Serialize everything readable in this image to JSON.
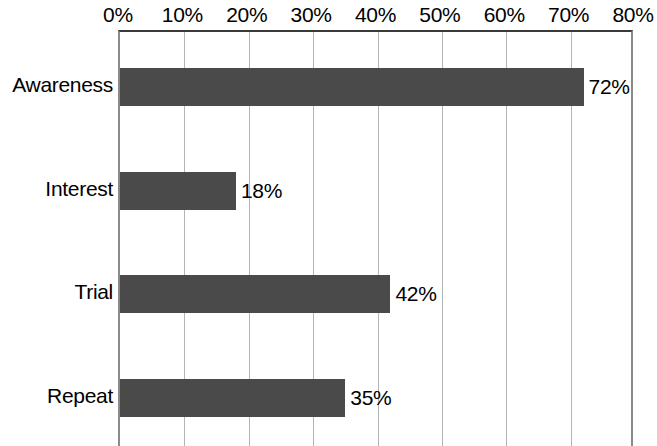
{
  "chart_data": {
    "type": "bar",
    "orientation": "horizontal",
    "title": "",
    "xlabel": "",
    "ylabel": "",
    "categories": [
      "Awareness",
      "Interest",
      "Trial",
      "Repeat"
    ],
    "values": [
      72,
      18,
      42,
      35
    ],
    "value_labels": [
      "72%",
      "18%",
      "42%",
      "35%"
    ],
    "xlim": [
      0,
      80
    ],
    "xticks": [
      0,
      10,
      20,
      30,
      40,
      50,
      60,
      70,
      80
    ],
    "xtick_labels": [
      "0%",
      "10%",
      "20%",
      "30%",
      "40%",
      "50%",
      "60%",
      "70%",
      "80%"
    ],
    "xaxis_position": "top",
    "grid": "vertical",
    "legend": "none",
    "bar_color": "#4a4a4a",
    "gridline_color": "#b4b4b4",
    "axis_color": "#3a3a3a",
    "background_color": "#ffffff"
  }
}
